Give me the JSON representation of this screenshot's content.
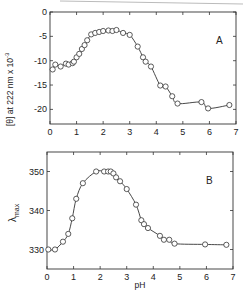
{
  "chart_data": [
    {
      "type": "scatter",
      "panel_label": "A",
      "title": "",
      "xlabel": "",
      "ylabel": "[θ] at 222 nm x 10",
      "ylabel_superscript": "-3",
      "xlim": [
        0,
        7
      ],
      "ylim": [
        -23,
        0
      ],
      "xticks": [
        "0",
        "1",
        "2",
        "3",
        "4",
        "5",
        "6",
        "7"
      ],
      "yticks": [
        "0",
        "-5",
        "-10",
        "-15",
        "-20"
      ],
      "ytick_values": [
        0,
        -5,
        -10,
        -15,
        -20
      ],
      "grid": false,
      "fit_line": true,
      "x": [
        0.1,
        0.2,
        0.4,
        0.6,
        0.7,
        0.85,
        0.9,
        1.0,
        1.1,
        1.2,
        1.3,
        1.4,
        1.55,
        1.7,
        1.85,
        2.0,
        2.2,
        2.35,
        2.5,
        2.75,
        3.0,
        3.3,
        3.5,
        3.6,
        3.8,
        4.15,
        4.35,
        4.6,
        4.8,
        5.7,
        5.95,
        6.75
      ],
      "y": [
        -11.8,
        -10.8,
        -11.2,
        -10.6,
        -10.8,
        -10.5,
        -10.2,
        -9.3,
        -8.6,
        -7.6,
        -6.8,
        -5.8,
        -4.6,
        -4.3,
        -4.1,
        -3.9,
        -3.8,
        -3.9,
        -3.7,
        -4.3,
        -4.7,
        -7.1,
        -9.3,
        -10.2,
        -11.2,
        -15.1,
        -15.3,
        -17.3,
        -18.8,
        -18.5,
        -19.8,
        -19.1
      ],
      "series": [
        {
          "name": "[θ] at 222 nm",
          "marker": "open-circle"
        }
      ]
    },
    {
      "type": "scatter",
      "panel_label": "B",
      "title": "",
      "xlabel": "pH",
      "ylabel": "λmax",
      "ylabel_main": "λ",
      "ylabel_sub": "max",
      "xlim": [
        0,
        7
      ],
      "ylim": [
        325,
        355
      ],
      "xticks": [
        "0",
        "1",
        "2",
        "3",
        "4",
        "5",
        "6",
        "7"
      ],
      "yticks": [
        "330",
        "340",
        "350"
      ],
      "ytick_values": [
        330,
        340,
        350
      ],
      "grid": false,
      "fit_line": true,
      "x": [
        0.05,
        0.3,
        0.6,
        0.8,
        0.95,
        1.1,
        1.35,
        1.85,
        2.15,
        2.3,
        2.4,
        2.5,
        2.6,
        2.75,
        3.0,
        3.35,
        3.55,
        3.65,
        3.8,
        4.25,
        4.4,
        4.6,
        4.8,
        5.95,
        6.75
      ],
      "y": [
        330,
        330,
        332,
        334,
        338,
        343,
        347,
        350,
        350,
        350,
        350,
        349.5,
        348.5,
        347.5,
        345.5,
        341.5,
        337.5,
        336.5,
        335.5,
        333.5,
        332.5,
        332.5,
        331.5,
        331.3,
        331.2
      ],
      "series": [
        {
          "name": "λmax",
          "marker": "open-circle"
        }
      ]
    }
  ]
}
